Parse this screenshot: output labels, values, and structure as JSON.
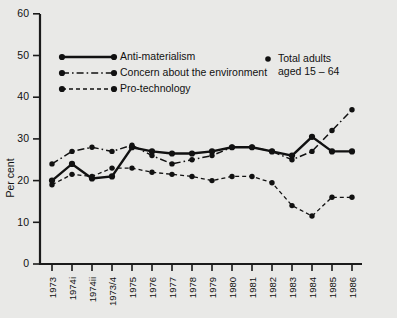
{
  "chart_data": {
    "type": "line",
    "title": "",
    "xlabel": "",
    "ylabel": "Per cent",
    "ylim": [
      0,
      60
    ],
    "yticks": [
      0,
      10,
      20,
      30,
      40,
      50,
      60
    ],
    "grid": false,
    "legend_position": "top-left",
    "categories": [
      "1973",
      "1974i",
      "1974ii",
      "1973/4",
      "1975",
      "1976",
      "1977",
      "1978",
      "1979",
      "1980",
      "1981",
      "1982",
      "1983",
      "1984",
      "1985",
      "1986"
    ],
    "series": [
      {
        "name": "Anti-materialism",
        "style": "solid",
        "marker": "circle",
        "values": [
          20,
          24,
          20.5,
          21,
          28,
          27,
          26.5,
          26.5,
          27,
          28,
          28,
          27,
          26,
          30.5,
          27,
          27
        ]
      },
      {
        "name": "Concern about the environment",
        "style": "dashdot",
        "marker": "circle",
        "values": [
          24,
          27,
          28,
          27,
          28.5,
          26,
          24,
          25,
          26,
          28,
          28,
          27,
          25,
          27,
          32,
          37
        ]
      },
      {
        "name": "Pro-technology",
        "style": "dashed",
        "marker": "circle",
        "values": [
          19,
          21.5,
          21,
          23,
          23,
          22,
          21.5,
          21,
          20,
          21,
          21,
          19.5,
          14,
          11.5,
          16,
          16
        ]
      }
    ],
    "annotations": [
      {
        "text_line1": "Total adults",
        "text_line2": "aged 15 –  64",
        "marker": "circle"
      }
    ],
    "colors": {
      "ink": "#111111",
      "background": "#e9e9e7"
    }
  },
  "legend": {
    "items": [
      {
        "label": "Anti-materialism"
      },
      {
        "label": "Concern about the environment"
      },
      {
        "label": "Pro-technology"
      }
    ]
  },
  "note": {
    "line1": "Total adults",
    "line2": "aged 15 –  64"
  }
}
